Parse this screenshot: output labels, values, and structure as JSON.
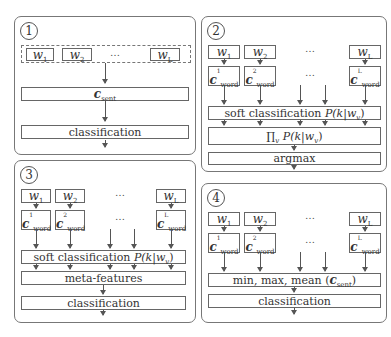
{
  "panels": [
    {
      "id": "1",
      "number": "1",
      "words": [
        "w",
        "w",
        "…",
        "w"
      ],
      "word_subs": [
        "1",
        "2",
        "",
        "L"
      ],
      "sent_vec": "c",
      "sent_sub": "sent",
      "classification": "classification"
    },
    {
      "id": "2",
      "number": "2",
      "words": [
        "w",
        "w",
        "…",
        "w"
      ],
      "word_subs": [
        "1",
        "2",
        "",
        "L"
      ],
      "word_vec": "c",
      "word_vec_sub": "word",
      "word_vec_sups": [
        "1",
        "2",
        "",
        "L"
      ],
      "dots": "…",
      "soft_label": "soft classification ",
      "soft_math": "P(k|w",
      "soft_math_sub": "v",
      "soft_math_end": ")",
      "product_label": "∏",
      "product_sub": "v",
      "product_math": " P(k|w",
      "product_math_sub": "v",
      "product_math_end": ")",
      "argmax": "argmax"
    },
    {
      "id": "3",
      "number": "3",
      "words": [
        "w",
        "w",
        "…",
        "w"
      ],
      "word_subs": [
        "1",
        "2",
        "",
        "L"
      ],
      "word_vec": "c",
      "word_vec_sub": "word",
      "word_vec_sups": [
        "1",
        "2",
        "",
        "L"
      ],
      "dots": "…",
      "soft_label": "soft classification ",
      "soft_math": "P(k|w",
      "soft_math_sub": "v",
      "soft_math_end": ")",
      "meta": "meta-features",
      "classification": "classification"
    },
    {
      "id": "4",
      "number": "4",
      "words": [
        "w",
        "w",
        "…",
        "w"
      ],
      "word_subs": [
        "1",
        "2",
        "",
        "L"
      ],
      "word_vec": "c",
      "word_vec_sub": "word",
      "word_vec_sups": [
        "1",
        "2",
        "",
        "L"
      ],
      "dots": "…",
      "pool_label": "min, max, mean (",
      "pool_vec": "c",
      "pool_vec_sub": "sent",
      "pool_end": ")",
      "classification": "classification"
    }
  ]
}
